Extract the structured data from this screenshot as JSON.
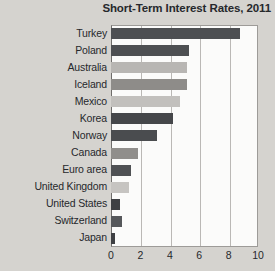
{
  "chart_data": {
    "type": "bar",
    "orientation": "horizontal",
    "title": "Short-Term Interest Rates, 2011",
    "xlabel": "",
    "ylabel": "",
    "xlim": [
      0,
      10
    ],
    "xticks": [
      "0",
      "2",
      "4",
      "6",
      "8",
      "10"
    ],
    "xtick_values": [
      0,
      2,
      4,
      6,
      8,
      10
    ],
    "grid": true,
    "legend": "none",
    "categories": [
      "Turkey",
      "Poland",
      "Australia",
      "Iceland",
      "Mexico",
      "Korea",
      "Norway",
      "Canada",
      "Euro area",
      "United Kingdom",
      "United States",
      "Switzerland",
      "Japan"
    ],
    "values": [
      8.8,
      5.3,
      5.2,
      5.2,
      4.7,
      4.2,
      3.1,
      1.85,
      1.35,
      1.2,
      0.6,
      0.75,
      0.3
    ],
    "bar_colors": [
      "#4d4f52",
      "#4d4f52",
      "#b8b6b3",
      "#8e8c89",
      "#c2c0bd",
      "#45474a",
      "#4a4c4f",
      "#908e8b",
      "#4f5154",
      "#c6c4c1",
      "#3e4043",
      "#55575a",
      "#3e4043"
    ]
  },
  "figure": {
    "background_color": "#d5d3cf",
    "plot_background_color": "#fbfbfa",
    "gridline_color": "#bab8b5",
    "axis_color": "#6f6d6b",
    "text_color": "#26282c"
  }
}
